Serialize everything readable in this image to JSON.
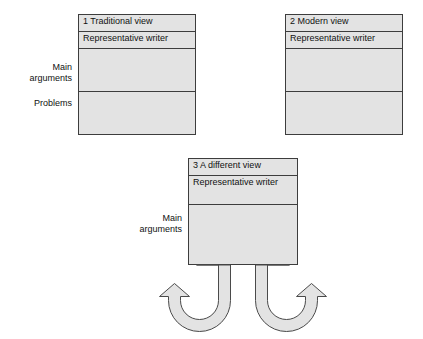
{
  "diagram": {
    "title_text": "",
    "colors": {
      "box_fill": "#e3e3e3",
      "box_border": "#3d3d3d",
      "arrow_fill": "#e3e3e3",
      "arrow_border": "#4a4a4a",
      "text": "#111111",
      "background": "#ffffff"
    },
    "row_labels": {
      "main_arguments_top": "Main\narguments",
      "problems": "Problems",
      "main_arguments_bottom": "Main\narguments"
    },
    "boxes": [
      {
        "id": "box1",
        "title": "1 Traditional view",
        "rows": [
          {
            "name": "representative-writer",
            "label": "Representative writer"
          },
          {
            "name": "main-arguments",
            "label": ""
          },
          {
            "name": "problems",
            "label": ""
          }
        ]
      },
      {
        "id": "box2",
        "title": "2 Modern view",
        "rows": [
          {
            "name": "representative-writer",
            "label": "Representative writer"
          },
          {
            "name": "main-arguments",
            "label": ""
          },
          {
            "name": "problems",
            "label": ""
          }
        ]
      },
      {
        "id": "box3",
        "title": "3 A different view",
        "rows": [
          {
            "name": "representative-writer",
            "label": "Representative writer"
          },
          {
            "name": "main-arguments",
            "label": ""
          }
        ]
      }
    ],
    "arrows": [
      {
        "name": "arrow-left",
        "direction": "curves-down-and-left",
        "points_to": "left"
      },
      {
        "name": "arrow-right",
        "direction": "curves-down-and-right",
        "points_to": "right"
      }
    ]
  }
}
